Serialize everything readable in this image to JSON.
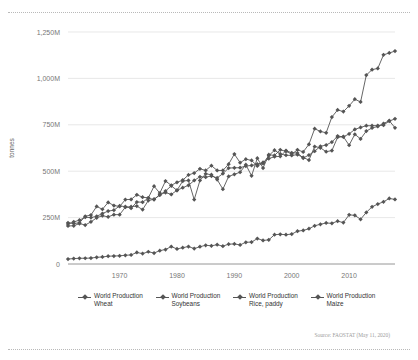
{
  "chart_data": {
    "type": "line",
    "title": "",
    "subtitle": "",
    "xlabel": "",
    "ylabel": "tonnes",
    "ylim": [
      0,
      1250000000
    ],
    "xlim": [
      1961,
      2018
    ],
    "grid": true,
    "legend_position": "bottom",
    "y_ticks": [
      "0",
      "250M",
      "500M",
      "750M",
      "1,000M",
      "1,250M"
    ],
    "y_tick_values": [
      0,
      250000000,
      500000000,
      750000000,
      1000000000,
      1250000000
    ],
    "x_ticks": [
      "1970",
      "1980",
      "1990",
      "2000",
      "2010"
    ],
    "x_tick_values": [
      1970,
      1980,
      1990,
      2000,
      2010
    ],
    "source": "Source: FAOSTAT (May 11, 2020)",
    "x": [
      1961,
      1962,
      1963,
      1964,
      1965,
      1966,
      1967,
      1968,
      1969,
      1970,
      1971,
      1972,
      1973,
      1974,
      1975,
      1976,
      1977,
      1978,
      1979,
      1980,
      1981,
      1982,
      1983,
      1984,
      1985,
      1986,
      1987,
      1988,
      1989,
      1990,
      1991,
      1992,
      1993,
      1994,
      1995,
      1996,
      1997,
      1998,
      1999,
      2000,
      2001,
      2002,
      2003,
      2004,
      2005,
      2006,
      2007,
      2008,
      2009,
      2010,
      2011,
      2012,
      2013,
      2014,
      2015,
      2016,
      2017,
      2018
    ],
    "series": [
      {
        "name": "World Production Wheat",
        "color": "#555555",
        "values": [
          222000000,
          218000000,
          222000000,
          257000000,
          264000000,
          310000000,
          295000000,
          332000000,
          315000000,
          310000000,
          347000000,
          348000000,
          373000000,
          360000000,
          356000000,
          419000000,
          382000000,
          447000000,
          424000000,
          440000000,
          452000000,
          480000000,
          490000000,
          513000000,
          504000000,
          530000000,
          504000000,
          504000000,
          538000000,
          592000000,
          546000000,
          565000000,
          558000000,
          528000000,
          542000000,
          584000000,
          613000000,
          593000000,
          586000000,
          585000000,
          589000000,
          574000000,
          560000000,
          633000000,
          626000000,
          605000000,
          611000000,
          683000000,
          686000000,
          640000000,
          699000000,
          674000000,
          716000000,
          733000000,
          741000000,
          757000000,
          772000000,
          734000000
        ]
      },
      {
        "name": "World Production Soybeans",
        "color": "#555555",
        "values": [
          26900000,
          29000000,
          30900000,
          31000000,
          32000000,
          36000000,
          38000000,
          42000000,
          43000000,
          44000000,
          47000000,
          49000000,
          62000000,
          56000000,
          66000000,
          59000000,
          72000000,
          78000000,
          94000000,
          81000000,
          88000000,
          94000000,
          83000000,
          93000000,
          101000000,
          98000000,
          104000000,
          96000000,
          107000000,
          108000000,
          103000000,
          117000000,
          118000000,
          137000000,
          127000000,
          130000000,
          158000000,
          160000000,
          158000000,
          161000000,
          177000000,
          181000000,
          190000000,
          206000000,
          214000000,
          221000000,
          219000000,
          231000000,
          223000000,
          265000000,
          262000000,
          241000000,
          278000000,
          308000000,
          323000000,
          335000000,
          353000000,
          348000000
        ]
      },
      {
        "name": "World Production Rice, paddy",
        "color": "#555555",
        "values": [
          215000000,
          227000000,
          236000000,
          252000000,
          250000000,
          257000000,
          272000000,
          285000000,
          290000000,
          313000000,
          309000000,
          301000000,
          334000000,
          333000000,
          355000000,
          347000000,
          373000000,
          385000000,
          375000000,
          397000000,
          411000000,
          424000000,
          450000000,
          470000000,
          468000000,
          474000000,
          464000000,
          487000000,
          517000000,
          518000000,
          519000000,
          528000000,
          531000000,
          538000000,
          547000000,
          568000000,
          578000000,
          580000000,
          611000000,
          599000000,
          598000000,
          571000000,
          587000000,
          608000000,
          634000000,
          641000000,
          657000000,
          689000000,
          685000000,
          701000000,
          725000000,
          736000000,
          745000000,
          745000000,
          746000000,
          748000000,
          770000000,
          782000000
        ]
      },
      {
        "name": "World Production Maize",
        "color": "#555555",
        "values": [
          205000000,
          206000000,
          218000000,
          210000000,
          227000000,
          249000000,
          260000000,
          254000000,
          266000000,
          266000000,
          306000000,
          309000000,
          312000000,
          293000000,
          342000000,
          349000000,
          372000000,
          393000000,
          421000000,
          397000000,
          447000000,
          450000000,
          347000000,
          450000000,
          486000000,
          481000000,
          455000000,
          403000000,
          472000000,
          483000000,
          495000000,
          535000000,
          475000000,
          570000000,
          517000000,
          589000000,
          585000000,
          615000000,
          607000000,
          592000000,
          615000000,
          604000000,
          645000000,
          729000000,
          714000000,
          707000000,
          792000000,
          830000000,
          821000000,
          852000000,
          888000000,
          873000000,
          1018000000,
          1047000000,
          1054000000,
          1127000000,
          1137000000,
          1147000000
        ]
      }
    ]
  },
  "legend": [
    {
      "label": "World Production Wheat"
    },
    {
      "label": "World Production Soybeans"
    },
    {
      "label": "World Production Rice, paddy"
    },
    {
      "label": "World Production Maize"
    }
  ],
  "axis": {
    "ylabel": "tonnes"
  },
  "footer": {
    "source": "Source: FAOSTAT (May 11, 2020)"
  }
}
